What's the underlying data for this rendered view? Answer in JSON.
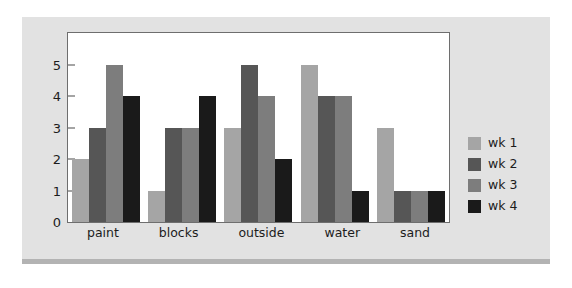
{
  "chart_data": {
    "type": "bar",
    "title": "",
    "subtitle": "",
    "xlabel": "",
    "ylabel": "",
    "categories": [
      "paint",
      "blocks",
      "outside",
      "water",
      "sand"
    ],
    "series": [
      {
        "name": "wk 1",
        "color": "#a5a5a5",
        "values": [
          2,
          1,
          3,
          5,
          3
        ]
      },
      {
        "name": "wk 2",
        "color": "#565656",
        "values": [
          3,
          3,
          5,
          4,
          1
        ]
      },
      {
        "name": "wk 3",
        "color": "#7d7d7d",
        "values": [
          5,
          3,
          4,
          4,
          1
        ]
      },
      {
        "name": "wk 4",
        "color": "#1a1a1a",
        "values": [
          4,
          4,
          2,
          1,
          1
        ]
      }
    ],
    "ylim": [
      0,
      6
    ],
    "yticks": [
      0,
      1,
      2,
      3,
      4,
      5
    ],
    "ytick_labels": [
      "0",
      "1",
      "2",
      "3",
      "4",
      "5"
    ],
    "grid": false,
    "legend_position": "right"
  },
  "legend": {
    "entries": [
      {
        "label": "wk 1"
      },
      {
        "label": "wk 2"
      },
      {
        "label": "wk 3"
      },
      {
        "label": "wk 4"
      }
    ]
  },
  "colors": {
    "page_background": "#ffffff",
    "panel_background": "#e2e2e2",
    "panel_base": "#b3b3b3",
    "plot_background": "#ffffff",
    "plot_border": "#6e6e6e",
    "text": "#1c1c1c",
    "tick": "#4a4a4a"
  }
}
